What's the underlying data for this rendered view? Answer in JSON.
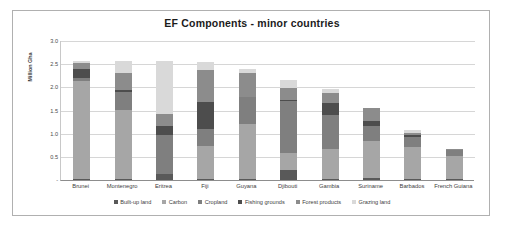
{
  "chart_data": {
    "type": "bar",
    "stacked": true,
    "title": "EF Components - minor countries",
    "xlabel": "",
    "ylabel": "Million Gha",
    "ylim": [
      0,
      3.0
    ],
    "yticks": [
      "-",
      "0.5",
      "1.0",
      "1.5",
      "2.0",
      "2.5",
      "3.0"
    ],
    "ytick_values": [
      0,
      0.5,
      1.0,
      1.5,
      2.0,
      2.5,
      3.0
    ],
    "grid": true,
    "legend_position": "bottom",
    "categories": [
      "Brunei",
      "Montenegro",
      "Eritrea",
      "Fiji",
      "Guyana",
      "Djibouti",
      "Gambia",
      "Suriname",
      "Barbados",
      "French Guiana"
    ],
    "series": [
      {
        "name": "Built-up land",
        "color": "#595959",
        "values": [
          0.03,
          0.03,
          0.13,
          0.03,
          0.03,
          0.22,
          0.03,
          0.05,
          0.03,
          0.02
        ]
      },
      {
        "name": "Carbon",
        "color": "#a6a6a6",
        "values": [
          2.1,
          1.48,
          0.0,
          0.71,
          1.17,
          0.36,
          0.64,
          0.8,
          0.68,
          0.5
        ]
      },
      {
        "name": "Cropland",
        "color": "#7f7f7f",
        "values": [
          0.07,
          0.4,
          0.85,
          0.37,
          0.59,
          1.12,
          0.73,
          0.32,
          0.21,
          0.12
        ]
      },
      {
        "name": "Fishing grounds",
        "color": "#4d4d4d",
        "values": [
          0.2,
          0.04,
          0.18,
          0.57,
          0.01,
          0.02,
          0.26,
          0.1,
          0.06,
          0.01
        ]
      },
      {
        "name": "Forest products",
        "color": "#8c8c8c",
        "values": [
          0.13,
          0.36,
          0.27,
          0.7,
          0.5,
          0.27,
          0.22,
          0.28,
          0.04,
          0.01
        ]
      },
      {
        "name": "Grazing land",
        "color": "#d9d9d9",
        "values": [
          0.03,
          0.25,
          1.13,
          0.17,
          0.1,
          0.18,
          0.09,
          0.0,
          0.05,
          0.0
        ]
      }
    ],
    "totals": [
      2.56,
      2.56,
      2.56,
      2.55,
      2.4,
      2.17,
      1.97,
      1.55,
      1.07,
      0.66
    ]
  },
  "legend": {
    "items": [
      {
        "label": "Built-up land"
      },
      {
        "label": "Carbon"
      },
      {
        "label": "Cropland"
      },
      {
        "label": "Fishing grounds"
      },
      {
        "label": "Forest products"
      },
      {
        "label": "Grazing land"
      }
    ]
  }
}
